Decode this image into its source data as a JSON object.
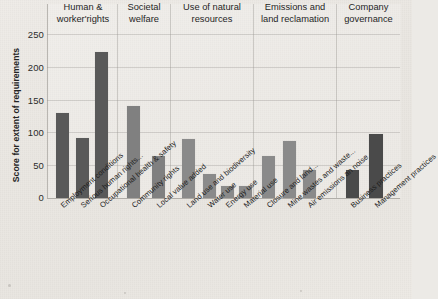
{
  "chart_data": {
    "type": "bar",
    "title": "",
    "xlabel": "",
    "ylabel": "Score for extent of requirements",
    "ylim": [
      0,
      250
    ],
    "yticks": [
      0,
      50,
      100,
      150,
      200,
      250
    ],
    "grid": true,
    "legend": "none",
    "categories": [
      "Employment conditions",
      "Serious human rights...",
      "Occupational health & safety",
      "Community rights",
      "Local value added",
      "Land use and biodiversity",
      "Water use",
      "Energy use",
      "Material use",
      "Closure and land...",
      "Mine wastes and waste...",
      "Air emissions an noise",
      "Business practices",
      "Management practices"
    ],
    "values": [
      130,
      91,
      222,
      140,
      64,
      90,
      36,
      19,
      19,
      64,
      87,
      43,
      42,
      97
    ],
    "groups": [
      {
        "label": "Human &\nworker'rights",
        "line1": "Human &",
        "line2": "worker'rights",
        "count": 3,
        "color": "#595959"
      },
      {
        "label": "Societal\nwelfare",
        "line1": "Societal",
        "line2": "welfare",
        "count": 2,
        "color": "#808080"
      },
      {
        "label": "Use of natural\nresources",
        "line1": "Use of natural",
        "line2": "resources",
        "count": 4,
        "color": "#8a8a8a"
      },
      {
        "label": "Emissions and\nland reclamation",
        "line1": "Emissions and",
        "line2": "land reclamation",
        "count": 3,
        "color": "#8a8a8a"
      },
      {
        "label": "Company\ngovernance",
        "line1": "Company",
        "line2": "governance",
        "count": 2,
        "color": "#4a4a4a"
      }
    ],
    "bar_colors": [
      "#595959",
      "#595959",
      "#595959",
      "#808080",
      "#808080",
      "#8a8a8a",
      "#8a8a8a",
      "#8a8a8a",
      "#8a8a8a",
      "#8a8a8a",
      "#8a8a8a",
      "#8a8a8a",
      "#4a4a4a",
      "#4a4a4a"
    ]
  },
  "axis": {
    "y_title": "Score for extent of requirements",
    "ticks": [
      "250",
      "200",
      "150",
      "100",
      "50",
      "0"
    ]
  },
  "groups": {
    "g0_l1": "Human &",
    "g0_l2": "worker'rights",
    "g1_l1": "Societal",
    "g1_l2": "welfare",
    "g2_l1": "Use of natural",
    "g2_l2": "resources",
    "g3_l1": "Emissions and",
    "g3_l2": "land reclamation",
    "g4_l1": "Company",
    "g4_l2": "governance"
  },
  "categories": {
    "c0": "Employment conditions",
    "c1": "Serious human rights...",
    "c2": "Occupational health & safety",
    "c3": "Community rights",
    "c4": "Local value added",
    "c5": "Land use and biodiversity",
    "c6": "Water use",
    "c7": "Energy use",
    "c8": "Material use",
    "c9": "Closure and land...",
    "c10": "Mine wastes and waste...",
    "c11": "Air emissions an noise",
    "c12": "Business practices",
    "c13": "Management practices"
  },
  "watermark": {
    "line1": "",
    "line2": ""
  },
  "colors": {
    "bar_dark": "#595959",
    "bar_mid": "#808080",
    "bar_light": "#8a8a8a",
    "bar_darkest": "#4a4a4a",
    "background": "#eceae6",
    "text": "#1f1f1f"
  }
}
